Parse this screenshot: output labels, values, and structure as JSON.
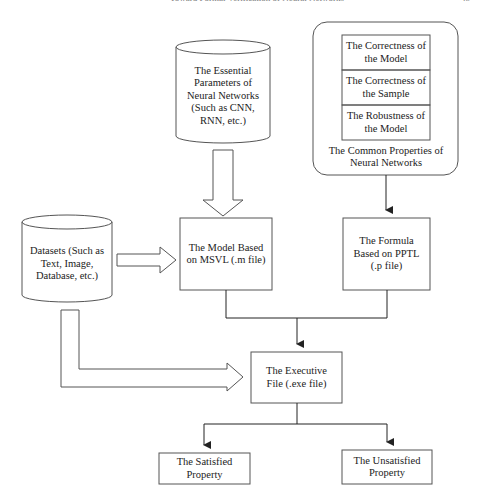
{
  "running_header": {
    "title": "Toward Formal Verification of Neural Networks",
    "page_number": "45"
  },
  "diagram": {
    "properties_group": {
      "caption": "The Common Properties of Neural Networks",
      "items": [
        "The Correctness of the Model",
        "The Correctness of the Sample",
        "The Robustness of the Model"
      ]
    },
    "essential_parameters": "The Essential Parameters of Neural Networks (Such as CNN, RNN, etc.)",
    "datasets": "Datasets (Such as Text, Image, Database, etc.)",
    "model": "The Model Based on MSVL (.m file)",
    "formula": "The Formula Based on PPTL (.p file)",
    "executive_file": "The Executive File (.exe file)",
    "satisfied": "The Satisfied Property",
    "unsatisfied": "The Unsatisfied Property"
  },
  "colors": {
    "stroke": "#555555",
    "text": "#222222",
    "background": "#ffffff"
  }
}
